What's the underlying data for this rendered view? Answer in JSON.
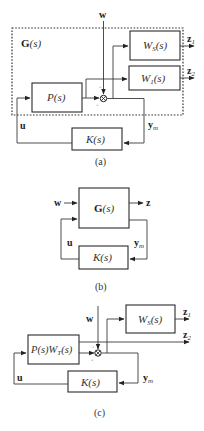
{
  "panels": [
    {
      "caption": "(a)",
      "group_label_bold": "G",
      "group_label_ital": "(s)",
      "blocks": {
        "plant": "P(s)",
        "ws_main": "W",
        "ws_sub": "S",
        "ws_tail": "(s)",
        "w1_main": "W",
        "w1_sub": "1",
        "w1_tail": "(s)",
        "controller": "K(s)"
      },
      "signals": {
        "w": "w",
        "z1_main": "z",
        "z1_sub": "1",
        "z2_main": "z",
        "z2_sub": "2",
        "u": "u",
        "ym_main": "y",
        "ym_sub": "m"
      },
      "junction_signs": [
        "+",
        "+"
      ]
    },
    {
      "caption": "(b)",
      "blocks": {
        "generalized_plant_bold": "G",
        "generalized_plant_ital": "(s)",
        "controller": "K(s)"
      },
      "signals": {
        "w": "w",
        "z": "z",
        "u": "u",
        "ym_main": "y",
        "ym_sub": "m"
      }
    },
    {
      "caption": "(c)",
      "blocks": {
        "plant_weighted_a": "P(s)W",
        "plant_weighted_sub": "T",
        "plant_weighted_b": "(s)",
        "ws_main": "W",
        "ws_sub": "S",
        "ws_tail": "(s)",
        "controller": "K(s)"
      },
      "signals": {
        "w": "w",
        "z1_main": "z",
        "z1_sub": "1",
        "z2_main": "z",
        "z2_sub": "2",
        "u": "u",
        "ym_main": "y",
        "ym_sub": "m"
      },
      "junction_signs": [
        "+",
        "+"
      ]
    }
  ]
}
